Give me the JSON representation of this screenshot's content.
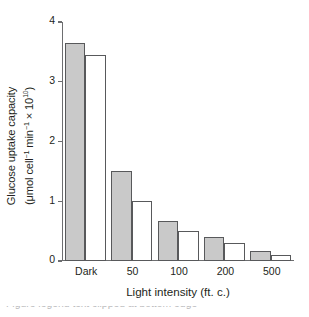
{
  "chart_data": {
    "type": "bar",
    "title": "",
    "xlabel": "Light intensity (ft. c.)",
    "ylabel_line1": "Glucose uptake capacity",
    "ylabel_line2_pre": "(μmol cell",
    "ylabel_line2_sup1": "−1",
    "ylabel_line2_mid": " min",
    "ylabel_line2_sup2": "−1",
    "ylabel_line2_post": " × 10",
    "ylabel_line2_sup3": "10",
    "ylabel_line2_end": ")",
    "ylabel_full": "Glucose uptake capacity (μmol cell−1 min−1 × 10^10)",
    "categories": [
      "Dark",
      "50",
      "100",
      "200",
      "500"
    ],
    "ylim": [
      0,
      4
    ],
    "yticks": [
      "0",
      "1",
      "2",
      "3",
      "4"
    ],
    "grid": false,
    "legend": "none",
    "series": [
      {
        "name": "gray-series",
        "color": "#c9c9c9",
        "values": [
          3.65,
          1.5,
          0.67,
          0.4,
          0.17
        ]
      },
      {
        "name": "white-series",
        "color": "#ffffff",
        "values": [
          3.45,
          1.0,
          0.5,
          0.3,
          0.1
        ]
      }
    ],
    "bar_outline_color": "#58595b",
    "axis_color": "#6d6e70"
  },
  "caption": {
    "clipped_text": "Figure legend text clipped at bottom edge"
  }
}
